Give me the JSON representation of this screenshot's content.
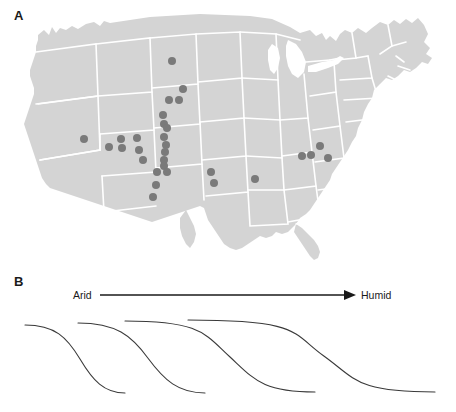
{
  "figure": {
    "background": "#ffffff",
    "panels": [
      {
        "id": "A",
        "label": "A",
        "type": "map"
      },
      {
        "id": "B",
        "label": "B",
        "type": "schematic-curves"
      }
    ]
  },
  "panel_a": {
    "label": "A",
    "map_name": "contiguous-united-states",
    "land_color": "#d4d4d4",
    "border_color": "#ffffff",
    "point_color": "#7a7a7a",
    "point_radius_px": 4.0,
    "point_count": 27,
    "points": [
      {
        "x": 172,
        "y": 61,
        "region": "north-dakota"
      },
      {
        "x": 183,
        "y": 89,
        "region": "south-dakota-east"
      },
      {
        "x": 169,
        "y": 100,
        "region": "south-dakota-west"
      },
      {
        "x": 179,
        "y": 100,
        "region": "south-dakota-central"
      },
      {
        "x": 163,
        "y": 115,
        "region": "nebraska-panhandle"
      },
      {
        "x": 164,
        "y": 124,
        "region": "nebraska-west"
      },
      {
        "x": 167,
        "y": 128,
        "region": "colorado-north"
      },
      {
        "x": 164,
        "y": 137,
        "region": "colorado-front-range"
      },
      {
        "x": 166,
        "y": 145,
        "region": "colorado-central"
      },
      {
        "x": 165,
        "y": 152,
        "region": "colorado-south"
      },
      {
        "x": 164,
        "y": 160,
        "region": "colorado-southeast"
      },
      {
        "x": 164,
        "y": 166,
        "region": "new-mexico-north"
      },
      {
        "x": 157,
        "y": 172,
        "region": "new-mexico-central-west"
      },
      {
        "x": 167,
        "y": 172,
        "region": "new-mexico-central-east"
      },
      {
        "x": 156,
        "y": 185,
        "region": "new-mexico-south"
      },
      {
        "x": 153,
        "y": 197,
        "region": "new-mexico-far-south"
      },
      {
        "x": 84,
        "y": 139,
        "region": "nevada"
      },
      {
        "x": 109,
        "y": 147,
        "region": "utah-southwest"
      },
      {
        "x": 121,
        "y": 139,
        "region": "utah-central"
      },
      {
        "x": 122,
        "y": 148,
        "region": "utah-south"
      },
      {
        "x": 137,
        "y": 138,
        "region": "colorado-west"
      },
      {
        "x": 139,
        "y": 150,
        "region": "colorado-southwest"
      },
      {
        "x": 143,
        "y": 160,
        "region": "new-mexico-northwest"
      },
      {
        "x": 211,
        "y": 172,
        "region": "kansas-oklahoma"
      },
      {
        "x": 214,
        "y": 183,
        "region": "oklahoma"
      },
      {
        "x": 255,
        "y": 179,
        "region": "missouri-arkansas"
      },
      {
        "x": 302,
        "y": 156,
        "region": "kentucky-west"
      },
      {
        "x": 311,
        "y": 155,
        "region": "kentucky-central"
      },
      {
        "x": 320,
        "y": 146,
        "region": "ohio-kentucky"
      },
      {
        "x": 328,
        "y": 158,
        "region": "kentucky-east"
      }
    ]
  },
  "panel_b": {
    "label": "B",
    "gradient_axis": {
      "left_label": "Arid",
      "right_label": "Humid",
      "arrow_direction": "right",
      "line_color": "#1a1a1a"
    },
    "curve_color": "#3a3a3a",
    "curve_count": 4,
    "curves": [
      {
        "name": "curve-1-arid",
        "x_start": 25,
        "x_end": 125,
        "y_top": 325,
        "y_bottom": 393,
        "steepness": "steep"
      },
      {
        "name": "curve-2",
        "x_start": 78,
        "x_end": 205,
        "y_top": 323,
        "y_bottom": 393,
        "steepness": "steep"
      },
      {
        "name": "curve-3",
        "x_start": 125,
        "x_end": 315,
        "y_top": 321,
        "y_bottom": 392,
        "steepness": "moderate"
      },
      {
        "name": "curve-4-humid",
        "x_start": 188,
        "x_end": 435,
        "y_top": 320,
        "y_bottom": 392,
        "steepness": "gradual"
      }
    ]
  }
}
